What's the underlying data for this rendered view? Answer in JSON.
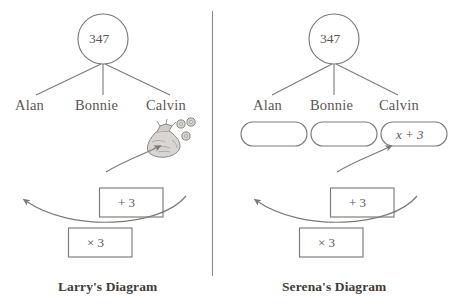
{
  "figure": {
    "type": "two-panel-comparison-diagram",
    "divider": "vertical-rule",
    "stroke_color": "#7c7a78",
    "text_color": "#5a5654"
  },
  "panels": [
    {
      "id": "larry",
      "caption": "Larry's Diagram",
      "root": {
        "label": "347",
        "shape": "circle"
      },
      "branches": [
        {
          "name": "Alan"
        },
        {
          "name": "Bonnie"
        },
        {
          "name": "Calvin"
        }
      ],
      "result_icon": {
        "name": "money-bag-icon",
        "coins": 3
      },
      "operations": [
        {
          "label": "+ 3",
          "shape": "rectangle"
        },
        {
          "label": "× 3",
          "shape": "rectangle"
        }
      ],
      "arrows": [
        {
          "name": "add-three-arrow",
          "direction": "up-right"
        },
        {
          "name": "times-three-arrow",
          "direction": "up-left"
        }
      ]
    },
    {
      "id": "serena",
      "caption": "Serena's Diagram",
      "root": {
        "label": "347",
        "shape": "circle"
      },
      "branches": [
        {
          "name": "Alan"
        },
        {
          "name": "Bonnie"
        },
        {
          "name": "Calvin"
        }
      ],
      "slots": [
        {
          "owner": "Alan",
          "value": ""
        },
        {
          "owner": "Bonnie",
          "value": ""
        },
        {
          "owner": "Calvin",
          "value": "x + 3"
        }
      ],
      "operations": [
        {
          "label": "+ 3",
          "shape": "rectangle"
        },
        {
          "label": "× 3",
          "shape": "rectangle"
        }
      ],
      "arrows": [
        {
          "name": "add-three-arrow",
          "direction": "up-right"
        },
        {
          "name": "times-three-arrow",
          "direction": "up-left"
        }
      ]
    }
  ]
}
